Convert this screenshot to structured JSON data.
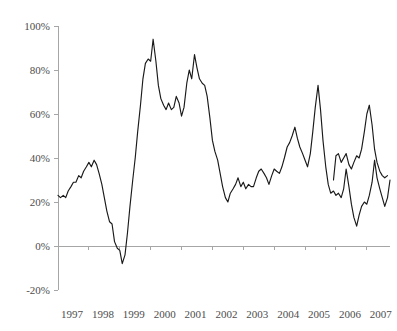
{
  "chart_data": {
    "type": "line",
    "title": "",
    "subtitle": "",
    "xlabel": "",
    "ylabel": "",
    "ylim": [
      -20,
      100
    ],
    "ytick_labels": [
      "100%",
      "80%",
      "60%",
      "40%",
      "20%",
      "0%",
      "-20%"
    ],
    "ytick_values": [
      100,
      80,
      60,
      40,
      20,
      0,
      -20
    ],
    "xtick_labels": [
      "1997",
      "1998",
      "1999",
      "2000",
      "2001",
      "2002",
      "2003",
      "2004",
      "2005",
      "2006",
      "2007"
    ],
    "xtick_values": [
      1997,
      1998,
      1999,
      2000,
      2001,
      2002,
      2003,
      2004,
      2005,
      2006,
      2007
    ],
    "grid": false,
    "legend": null,
    "legend_position": "none",
    "line_color": "#1a1a1a",
    "axis_color": "#a6a6a6",
    "label_color": "#4d4d4d",
    "x_start": 1997.0,
    "x_end": 2007.75,
    "series": [
      {
        "name": "series-1",
        "x": [
          1997.0,
          1997.08,
          1997.17,
          1997.25,
          1997.33,
          1997.42,
          1997.5,
          1997.58,
          1997.67,
          1997.75,
          1997.83,
          1997.92,
          1998.0,
          1998.08,
          1998.17,
          1998.25,
          1998.33,
          1998.42,
          1998.5,
          1998.58,
          1998.67,
          1998.75,
          1998.83,
          1998.92,
          1999.0,
          1999.08,
          1999.17,
          1999.25,
          1999.33,
          1999.42,
          1999.5,
          1999.58,
          1999.67,
          1999.75,
          1999.83,
          1999.92,
          2000.0,
          2000.08,
          2000.17,
          2000.25,
          2000.33,
          2000.42,
          2000.5,
          2000.58,
          2000.67,
          2000.75,
          2000.83,
          2000.92,
          2001.0,
          2001.08,
          2001.17,
          2001.25,
          2001.33,
          2001.42,
          2001.5,
          2001.58,
          2001.67,
          2001.75,
          2001.83,
          2001.92,
          2002.0,
          2002.08,
          2002.17,
          2002.25,
          2002.33,
          2002.42,
          2002.5,
          2002.58,
          2002.67,
          2002.75,
          2002.83,
          2002.92,
          2003.0,
          2003.08,
          2003.17,
          2003.25,
          2003.33,
          2003.42,
          2003.5,
          2003.58,
          2003.67,
          2003.75,
          2003.83,
          2003.92,
          2004.0,
          2004.08,
          2004.17,
          2004.25,
          2004.33,
          2004.42,
          2004.5,
          2004.58,
          2004.67,
          2004.75,
          2004.83,
          2004.92,
          2005.0,
          2005.08,
          2005.17,
          2005.25,
          2005.33,
          2005.42,
          2005.5,
          2005.58,
          2005.67,
          2005.75,
          2005.83,
          2005.92,
          2006.0,
          2006.08,
          2006.17,
          2006.25,
          2006.33,
          2006.42,
          2006.5,
          2006.58,
          2006.67,
          2006.75,
          2006.83,
          2006.92,
          2007.0,
          2007.08,
          2007.17,
          2007.25,
          2007.33,
          2007.42,
          2007.5,
          2007.58,
          2007.67,
          2007.75
        ],
        "values": [
          23,
          22,
          23,
          22,
          25,
          27,
          29,
          29,
          32,
          31,
          34,
          36,
          38,
          36,
          39,
          37,
          33,
          28,
          22,
          16,
          11,
          10,
          2,
          -1,
          -2,
          -8,
          -4,
          6,
          18,
          30,
          40,
          52,
          64,
          76,
          83,
          85,
          84,
          94,
          84,
          73,
          67,
          64,
          62,
          65,
          62,
          63,
          68,
          65,
          59,
          63,
          74,
          80,
          76,
          87,
          81,
          76,
          74,
          73,
          68,
          58,
          48,
          43,
          39,
          33,
          27,
          22,
          20,
          24,
          26,
          28,
          31,
          27,
          29,
          26,
          28,
          27,
          27,
          31,
          34,
          35,
          33,
          31,
          28,
          32,
          35,
          34,
          33,
          36,
          40,
          45,
          47,
          50,
          54,
          49,
          45,
          42,
          39,
          36,
          42,
          52,
          63,
          73,
          62,
          48,
          36,
          28,
          24,
          25,
          23,
          24,
          22,
          26,
          35,
          27,
          19,
          13,
          9,
          14,
          18,
          20,
          19,
          23,
          29,
          39,
          31,
          26,
          22,
          18,
          22,
          30
        ]
      },
      {
        "name": "series-1-tail",
        "x": [
          2005.92,
          2006.0,
          2006.08,
          2006.17,
          2006.25,
          2006.33,
          2006.42,
          2006.5,
          2006.58,
          2006.67,
          2006.75,
          2006.83,
          2006.92,
          2007.0,
          2007.08,
          2007.17,
          2007.25,
          2007.33,
          2007.42,
          2007.5,
          2007.58,
          2007.67
        ],
        "values": [
          30,
          41,
          42,
          38,
          40,
          42,
          37,
          35,
          38,
          41,
          40,
          44,
          52,
          60,
          64,
          55,
          44,
          38,
          34,
          32,
          31,
          32
        ]
      }
    ]
  }
}
